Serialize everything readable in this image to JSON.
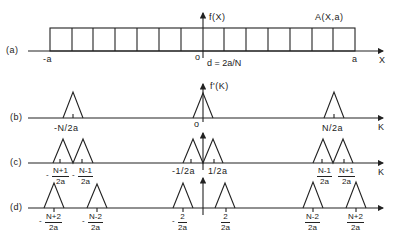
{
  "figure": {
    "rows": [
      {
        "id": "a",
        "label": "(a)"
      },
      {
        "id": "b",
        "label": "(b)"
      },
      {
        "id": "c",
        "label": "(c)"
      },
      {
        "id": "d",
        "label": "(d)"
      }
    ],
    "row_a": {
      "function_label": "f(X)",
      "aperture_label": "A(X,a)",
      "left_tick": "-a",
      "origin_tick": "o",
      "right_tick": "a",
      "axis_label": "X",
      "spacing_label": "d = 2a/N",
      "cells": 14
    },
    "row_b": {
      "function_label": "f'(K)",
      "left_tick": "-N/2a",
      "origin_tick": "o",
      "right_tick": "N/2a",
      "axis_label": "K"
    },
    "row_c": {
      "left_ticks": [
        {
          "sign": "-",
          "num": "N+1",
          "den": "2a"
        },
        {
          "sign": "-",
          "num": "N-1",
          "den": "2a"
        }
      ],
      "center_ticks": [
        "-1/2a",
        "1/2a"
      ],
      "right_ticks": [
        {
          "num": "N-1",
          "den": "2a"
        },
        {
          "num": "N+1",
          "den": "2a"
        }
      ],
      "axis_label": "K"
    },
    "row_d": {
      "left_ticks": [
        {
          "sign": "-",
          "num": "N+2",
          "den": "2a"
        },
        {
          "sign": "-",
          "num": "N-2",
          "den": "2a"
        }
      ],
      "center_ticks": [
        {
          "sign": "-",
          "num": "2",
          "den": "2a"
        },
        {
          "num": "2",
          "den": "2a"
        }
      ],
      "right_ticks": [
        {
          "num": "N-2",
          "den": "2a"
        },
        {
          "num": "N+2",
          "den": "2a"
        }
      ]
    }
  },
  "colors": {
    "ink": "#222222",
    "background": "#ffffff"
  }
}
